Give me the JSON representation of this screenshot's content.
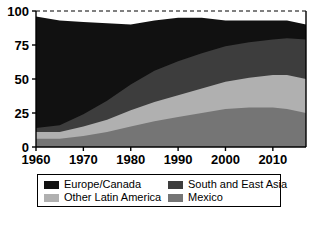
{
  "chart_data": {
    "type": "area",
    "stacked": true,
    "title": "",
    "subtitle": "",
    "xlabel": "",
    "ylabel": "",
    "xlim": [
      1960,
      2017
    ],
    "ylim": [
      0,
      100
    ],
    "grid": false,
    "legend_position": "bottom",
    "x_ticks": [
      1960,
      1970,
      1980,
      1990,
      2000,
      2010
    ],
    "y_ticks": [
      0,
      25,
      50,
      75,
      100
    ],
    "reference_line": {
      "value": 100,
      "style": "dashed"
    },
    "x": [
      1960,
      1965,
      1970,
      1975,
      1980,
      1985,
      1990,
      1995,
      2000,
      2005,
      2010,
      2013,
      2017
    ],
    "series": [
      {
        "name": "Mexico",
        "color": "#757575",
        "values": [
          6,
          6,
          8,
          11,
          15,
          19,
          22,
          25,
          28,
          29,
          29,
          28,
          25
        ]
      },
      {
        "name": "Other Latin America",
        "color": "#b0b0b0",
        "values": [
          5,
          5,
          7,
          9,
          12,
          14,
          16,
          18,
          20,
          22,
          24,
          25,
          25
        ]
      },
      {
        "name": "South and East Asia",
        "color": "#3d3d3d",
        "values": [
          3,
          5,
          9,
          14,
          19,
          23,
          25,
          26,
          26,
          26,
          26,
          27,
          29
        ]
      },
      {
        "name": "Europe/Canada",
        "color": "#111111",
        "values": [
          82,
          77,
          68,
          57,
          44,
          37,
          32,
          26,
          19,
          16,
          14,
          13,
          11
        ]
      }
    ],
    "cumulative_top_edges": {
      "mexico": [
        6,
        6,
        8,
        11,
        15,
        19,
        22,
        25,
        28,
        29,
        29,
        28,
        25
      ],
      "other_latin_america": [
        11,
        11,
        15,
        20,
        27,
        33,
        38,
        43,
        48,
        51,
        53,
        53,
        50
      ],
      "south_and_east_asia": [
        14,
        16,
        24,
        34,
        46,
        56,
        63,
        69,
        74,
        77,
        79,
        80,
        79
      ],
      "europe_canada": [
        96,
        93,
        92,
        91,
        90,
        93,
        95,
        95,
        93,
        93,
        93,
        93,
        90
      ]
    }
  },
  "legend": {
    "entries": [
      {
        "label": "Europe/Canada",
        "color": "#111111"
      },
      {
        "label": "South and East Asia",
        "color": "#3d3d3d"
      },
      {
        "label": "Other Latin America",
        "color": "#b0b0b0"
      },
      {
        "label": "Mexico",
        "color": "#757575"
      }
    ]
  },
  "caption": {
    "text": ""
  }
}
